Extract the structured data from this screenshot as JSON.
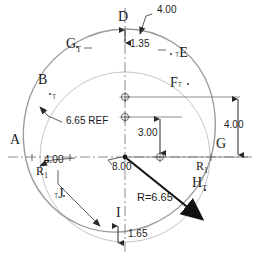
{
  "drawing": {
    "title": "Cam profile engineering drawing",
    "colors": {
      "outline": "#9a9a9a",
      "reference_circle": "#b4b4b4",
      "dimension": "#4a4a4a",
      "centerline": "#6e6e6e",
      "radius_arrow": "#111111",
      "text": "#1a1a1a"
    }
  },
  "point_labels": [
    {
      "id": "A",
      "text": "A",
      "sub": "",
      "x": 10,
      "y": 140
    },
    {
      "id": "B",
      "text": "B",
      "sub": "",
      "x": 38,
      "y": 80
    },
    {
      "id": "D",
      "text": "D",
      "sub": "",
      "x": 118,
      "y": 17
    },
    {
      "id": "E",
      "text": "E",
      "sub": "",
      "sup": "T",
      "x": 175,
      "y": 50
    },
    {
      "id": "F",
      "text": "F",
      "sub": "",
      "sup": "T",
      "x": 172,
      "y": 82
    },
    {
      "id": "G-top",
      "text": "G",
      "sub": "T",
      "x": 68,
      "y": 43
    },
    {
      "id": "G-right",
      "text": "G",
      "sub": "",
      "x": 218,
      "y": 143
    },
    {
      "id": "H",
      "text": "H",
      "sub": "T",
      "x": 196,
      "y": 183
    },
    {
      "id": "I",
      "text": "I",
      "sub": "",
      "x": 117,
      "y": 213
    },
    {
      "id": "J",
      "text": "J",
      "sub": "",
      "sup": "T",
      "x": 55,
      "y": 192
    }
  ],
  "dimensions": [
    {
      "id": "top-leader",
      "value": "4.00",
      "x": 158,
      "y": 10
    },
    {
      "id": "top-vertical",
      "value": "1.35",
      "x": 129,
      "y": 44
    },
    {
      "id": "ref-circle",
      "value": "6.65 REF",
      "x": 67,
      "y": 120
    },
    {
      "id": "left-horizontal",
      "value": "4.00",
      "x": 45,
      "y": 160
    },
    {
      "id": "center-offset",
      "value": "3.00",
      "x": 140,
      "y": 124
    },
    {
      "id": "right-vertical",
      "value": "4.00",
      "x": 228,
      "y": 120
    },
    {
      "id": "center-leader",
      "value": "8.00",
      "x": 114,
      "y": 165
    },
    {
      "id": "radius",
      "value": "R=6.65",
      "x": 140,
      "y": 198
    },
    {
      "id": "bottom-vertical",
      "value": "1.65",
      "x": 130,
      "y": 235
    }
  ],
  "radius_symbols": [
    {
      "id": "r1-left",
      "text": "R",
      "sub": "1",
      "x": 38,
      "y": 170
    },
    {
      "id": "r1-right",
      "text": "R",
      "sub": "1",
      "x": 198,
      "y": 165
    }
  ]
}
